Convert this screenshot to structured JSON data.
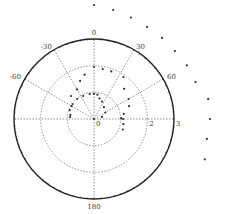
{
  "chart_data": {
    "type": "scatter",
    "subtype": "polar",
    "title": "",
    "theta_direction": "clockwise",
    "theta_zero": "top",
    "theta_tick_labels": [
      {
        "angle": 0,
        "label": "0"
      },
      {
        "angle": 30,
        "label": "30"
      },
      {
        "angle": 60,
        "label": "60"
      },
      {
        "angle": -30,
        "label": "-30"
      },
      {
        "angle": -60,
        "label": "-60"
      },
      {
        "angle": 180,
        "label": "180"
      }
    ],
    "spokes": [
      0,
      30,
      60,
      90,
      180,
      -30,
      -60,
      -90
    ],
    "r_ticks": [
      {
        "r": 0,
        "label": "0"
      },
      {
        "r": 1,
        "label": "1"
      },
      {
        "r": 2,
        "label": "2"
      },
      {
        "r": 3,
        "label": "3"
      }
    ],
    "rlim": [
      0,
      3
    ],
    "grid": true,
    "marker_color": "#333333",
    "series": [
      {
        "name": "spiral",
        "points": [
          {
            "theta": 0,
            "r": 0.0
          },
          {
            "theta": 75,
            "r": 0.31
          },
          {
            "theta": 60,
            "r": 0.49
          },
          {
            "theta": 40,
            "r": 0.58
          },
          {
            "theta": 25,
            "r": 0.72
          },
          {
            "theta": 15,
            "r": 0.8
          },
          {
            "theta": 8,
            "r": 0.92
          },
          {
            "theta": 0,
            "r": 0.94
          },
          {
            "theta": -10,
            "r": 0.95
          },
          {
            "theta": -25,
            "r": 0.95
          },
          {
            "theta": -40,
            "r": 0.98
          },
          {
            "theta": -55,
            "r": 0.98
          },
          {
            "theta": -70,
            "r": 0.97
          },
          {
            "theta": -80,
            "r": 0.9
          },
          {
            "theta": -85,
            "r": 0.9
          },
          {
            "theta": -60,
            "r": 0.97
          },
          {
            "theta": -45,
            "r": 1.22
          },
          {
            "theta": -30,
            "r": 1.28
          },
          {
            "theta": -20,
            "r": 1.52
          },
          {
            "theta": -12,
            "r": 1.7
          },
          {
            "theta": 0,
            "r": 1.95
          },
          {
            "theta": 10,
            "r": 1.9
          },
          {
            "theta": 20,
            "r": 1.9
          },
          {
            "theta": 35,
            "r": 1.92
          },
          {
            "theta": 45,
            "r": 1.6
          },
          {
            "theta": 60,
            "r": 1.5
          },
          {
            "theta": 70,
            "r": 1.4
          },
          {
            "theta": 80,
            "r": 1.13
          },
          {
            "theta": 88,
            "r": 1.02
          },
          {
            "theta": 90,
            "r": 1.09
          },
          {
            "theta": 100,
            "r": 1.12
          },
          {
            "theta": 110,
            "r": 1.15
          },
          {
            "theta": 0,
            "r": 4.27
          },
          {
            "theta": 10,
            "r": 4.15
          },
          {
            "theta": 20,
            "r": 4.05
          },
          {
            "theta": 30,
            "r": 3.98
          },
          {
            "theta": 40,
            "r": 3.97
          },
          {
            "theta": 50,
            "r": 3.96
          },
          {
            "theta": 60,
            "r": 4.02
          },
          {
            "theta": 70,
            "r": 4.05
          },
          {
            "theta": 80,
            "r": 4.35
          },
          {
            "theta": 90,
            "r": 4.35
          },
          {
            "theta": 100,
            "r": 4.3
          },
          {
            "theta": 110,
            "r": 4.42
          }
        ]
      }
    ]
  }
}
